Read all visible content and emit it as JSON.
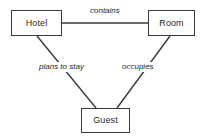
{
  "diagram": {
    "type": "entity-relationship-diagram",
    "background_color": "#ffffff",
    "line_color": "#3a3a3a",
    "text_color": "#2b2b2b",
    "entities": [
      {
        "id": "hotel",
        "label": "Hotel"
      },
      {
        "id": "room",
        "label": "Room"
      },
      {
        "id": "guest",
        "label": "Guest"
      }
    ],
    "relationships": [
      {
        "id": "contains",
        "label": "contains",
        "from": "Hotel",
        "to": "Room"
      },
      {
        "id": "plans_to_stay",
        "label": "plans to stay",
        "from": "Hotel",
        "to": "Guest"
      },
      {
        "id": "occupies",
        "label": "occupies",
        "from": "Room",
        "to": "Guest"
      }
    ]
  }
}
